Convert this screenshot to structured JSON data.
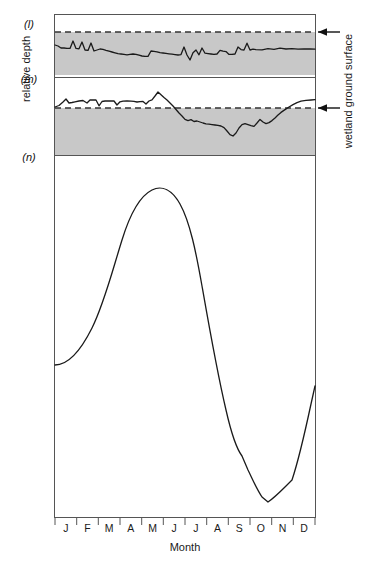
{
  "figure": {
    "axis_labels": {
      "y_left": "relative depth",
      "y_right": "wetland ground surface",
      "x_bottom": "Month"
    },
    "months": [
      "J",
      "F",
      "M",
      "A",
      "M",
      "J",
      "J",
      "A",
      "S",
      "O",
      "N",
      "D"
    ],
    "colors": {
      "shading": "#c8c8c8",
      "line": "#1a1a1a",
      "frame": "#555555",
      "dashed": "#333333",
      "background": "#ffffff"
    },
    "panels": [
      {
        "key": "(l)",
        "title": "Rich fen - North Wales",
        "has_shading": true,
        "has_ground_surface_line": true,
        "ground_surface_arrow": true
      },
      {
        "key": "(m)",
        "title": "Pocosin or Carolina Bay",
        "has_shading": true,
        "has_ground_surface_line": true,
        "ground_surface_arrow": true
      },
      {
        "key": "(n)",
        "title": "Tropical floodplain wetland - Brazil",
        "has_shading": false,
        "has_ground_surface_line": false,
        "ground_surface_arrow": false
      }
    ]
  },
  "chart_data": [
    {
      "type": "line",
      "panel": "(l)",
      "title": "Rich fen - North Wales",
      "xlabel": "Month",
      "ylabel": "relative depth",
      "categories": [
        "J",
        "F",
        "M",
        "A",
        "M",
        "J",
        "J",
        "A",
        "S",
        "O",
        "N",
        "D"
      ],
      "ylim": [
        -1,
        0.1
      ],
      "annotations": [
        "wetland ground surface"
      ],
      "note": "Water table remains continuously below the wetland ground surface; small high-frequency fluctuations.",
      "x": [
        0,
        1.2,
        2.5,
        4,
        5.5,
        7,
        8.2,
        9.5,
        11,
        12.5,
        14,
        15.5,
        17,
        18.5,
        20,
        21.5,
        23,
        24.5,
        26,
        27.5,
        29,
        30.5,
        32,
        33.5,
        35,
        36.5,
        38,
        39.5,
        41,
        42.5,
        44,
        45.5,
        47,
        48.5,
        50,
        51.5,
        53,
        54.5,
        56,
        57.5,
        59,
        60.5,
        62,
        63.5,
        65,
        66.5,
        68,
        69.5,
        71,
        72.5,
        74,
        75.5,
        77,
        78.5,
        80,
        81.5,
        83,
        84.5,
        86,
        87.5,
        89,
        90.5,
        92,
        93.5,
        95,
        96.5,
        98,
        100
      ],
      "values": [
        -0.3,
        -0.33,
        -0.4,
        -0.4,
        -0.41,
        -0.41,
        -0.23,
        -0.41,
        -0.42,
        -0.25,
        -0.44,
        -0.45,
        -0.27,
        -0.46,
        -0.44,
        -0.42,
        -0.43,
        -0.46,
        -0.48,
        -0.5,
        -0.52,
        -0.54,
        -0.55,
        -0.56,
        -0.57,
        -0.56,
        -0.55,
        -0.56,
        -0.58,
        -0.6,
        -0.61,
        -0.61,
        -0.48,
        -0.49,
        -0.5,
        -0.52,
        -0.53,
        -0.54,
        -0.55,
        -0.56,
        -0.57,
        -0.58,
        -0.57,
        -0.38,
        -0.58,
        -0.7,
        -0.52,
        -0.45,
        -0.57,
        -0.4,
        -0.55,
        -0.56,
        -0.57,
        -0.58,
        -0.57,
        -0.48,
        -0.5,
        -0.51,
        -0.58,
        -0.58,
        -0.57,
        -0.38,
        -0.44,
        -0.45,
        -0.28,
        -0.45,
        -0.43,
        -0.44
      ]
    },
    {
      "type": "line",
      "panel": "(m)",
      "title": "Pocosin or Carolina Bay",
      "xlabel": "Month",
      "ylabel": "relative depth",
      "categories": [
        "J",
        "F",
        "M",
        "A",
        "M",
        "J",
        "J",
        "A",
        "S",
        "O",
        "N",
        "D"
      ],
      "ylim": [
        -1,
        0.6
      ],
      "annotations": [
        "wetland ground surface"
      ],
      "note": "Water table starts above the wetland ground surface in winter/spring, falls well below in summer and autumn, then recovers to the surface in December.",
      "x": [
        0,
        2,
        4,
        6,
        8,
        10,
        12,
        14,
        16,
        18,
        20,
        22,
        24,
        26,
        28,
        30,
        32,
        34,
        36,
        38,
        40,
        42,
        44,
        46,
        48,
        50,
        52,
        54,
        56,
        58,
        60,
        62,
        64,
        66,
        68,
        70,
        72,
        74,
        76,
        78,
        80,
        82,
        84,
        86,
        88,
        90,
        92,
        94,
        96,
        98,
        100
      ],
      "values": [
        0.16,
        0.22,
        0.34,
        0.22,
        0.24,
        0.26,
        0.17,
        0.28,
        0.3,
        0.3,
        0.18,
        0.3,
        0.13,
        0.24,
        0.22,
        0.22,
        0.22,
        0.13,
        0.23,
        0.3,
        0.52,
        0.46,
        0.36,
        0.2,
        0.02,
        -0.16,
        -0.28,
        -0.24,
        -0.32,
        -0.3,
        -0.34,
        -0.38,
        -0.4,
        -0.41,
        -0.42,
        -0.52,
        -0.66,
        -0.7,
        -0.5,
        -0.38,
        -0.36,
        -0.4,
        -0.42,
        -0.22,
        -0.36,
        -0.3,
        -0.26,
        -0.14,
        -0.02,
        0.14,
        0.26
      ]
    },
    {
      "type": "line",
      "panel": "(n)",
      "title": "Tropical floodplain wetland - Brazil",
      "xlabel": "Month",
      "ylabel": "relative depth",
      "categories": [
        "J",
        "F",
        "M",
        "A",
        "M",
        "J",
        "J",
        "A",
        "S",
        "O",
        "N",
        "D"
      ],
      "ylim": [
        0,
        1
      ],
      "note": "Strong unimodal seasonal flood pulse: rises from January, peaks around June, falls steeply to a minimum in November, then rises sharply in December.",
      "monthly_values": [
        0.47,
        0.56,
        0.7,
        0.86,
        0.96,
        0.99,
        0.93,
        0.76,
        0.5,
        0.17,
        0.08,
        0.2
      ],
      "peak_month": "J",
      "trough_month": "N",
      "end_value": 0.62
    }
  ]
}
